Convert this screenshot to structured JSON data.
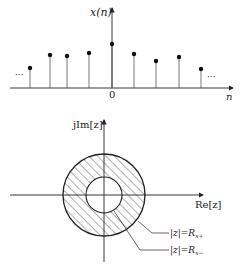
{
  "top_plot": {
    "y_label": "x(n)",
    "x_label": "n",
    "origin_label": "0",
    "ellipsis_left": "···",
    "ellipsis_right": "···",
    "samples": [
      {
        "x": 30,
        "y": 68
      },
      {
        "x": 50,
        "y": 55
      },
      {
        "x": 67,
        "y": 56
      },
      {
        "x": 89,
        "y": 53
      },
      {
        "x": 112,
        "y": 44
      },
      {
        "x": 134,
        "y": 54
      },
      {
        "x": 156,
        "y": 61
      },
      {
        "x": 179,
        "y": 57
      },
      {
        "x": 201,
        "y": 69
      }
    ]
  },
  "bottom_plot": {
    "y_label": "jIm[z]",
    "x_label": "Re[z]",
    "outer_label": "|z|=R",
    "outer_sub": "x+",
    "inner_label": "|z|=R",
    "inner_sub": "x−"
  },
  "colors": {
    "ink": "#222222",
    "background": "#ffffff"
  }
}
